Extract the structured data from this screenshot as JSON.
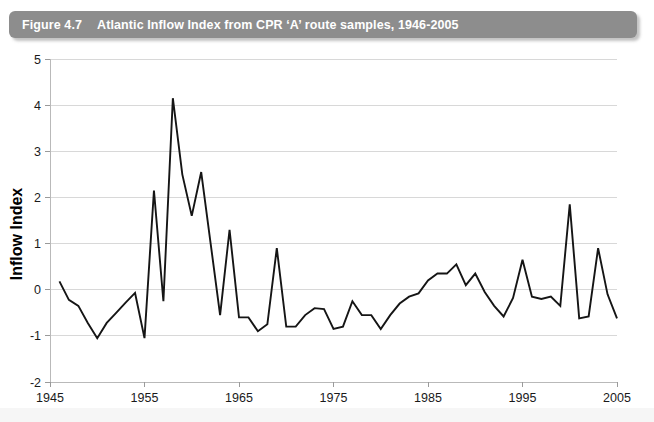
{
  "caption": {
    "number": "Figure 4.7",
    "text": "Atlantic Inflow Index from CPR ‘A’ route samples, 1946-2005"
  },
  "chart_data": {
    "type": "line",
    "title": "Atlantic Inflow Index from CPR ‘A’ route samples, 1946-2005",
    "xlabel": "",
    "ylabel": "Inflow Index",
    "xlim": [
      1945,
      2005
    ],
    "ylim": [
      -2,
      5
    ],
    "xticks": [
      1945,
      1955,
      1965,
      1975,
      1985,
      1995,
      2005
    ],
    "xticklabels": [
      "1945",
      "1955",
      "1965",
      "1975",
      "1985",
      "1995",
      "2005"
    ],
    "yticks": [
      -2,
      -1,
      0,
      1,
      2,
      3,
      4,
      5
    ],
    "yticklabels": [
      "-2",
      "-1",
      "0",
      "1",
      "2",
      "3",
      "4",
      "5"
    ],
    "grid": "horizontal",
    "legend": "none",
    "series": [
      {
        "name": "Inflow Index",
        "color": "#151515",
        "x": [
          1946,
          1947,
          1948,
          1949,
          1950,
          1951,
          1952,
          1953,
          1954,
          1955,
          1956,
          1957,
          1958,
          1959,
          1960,
          1961,
          1962,
          1963,
          1964,
          1965,
          1966,
          1967,
          1968,
          1969,
          1970,
          1971,
          1972,
          1973,
          1974,
          1975,
          1976,
          1977,
          1978,
          1979,
          1980,
          1981,
          1982,
          1983,
          1984,
          1985,
          1986,
          1987,
          1988,
          1989,
          1990,
          1991,
          1992,
          1993,
          1994,
          1995,
          1996,
          1997,
          1998,
          1999,
          2000,
          2001,
          2002,
          2003,
          2004,
          2005
        ],
        "y": [
          0.18,
          -0.22,
          -0.35,
          -0.72,
          -1.05,
          -0.72,
          -0.5,
          -0.28,
          -0.07,
          -1.05,
          2.15,
          -0.25,
          4.15,
          2.5,
          1.6,
          2.55,
          1.0,
          -0.55,
          1.3,
          -0.6,
          -0.6,
          -0.9,
          -0.75,
          0.9,
          -0.8,
          -0.8,
          -0.55,
          -0.4,
          -0.42,
          -0.85,
          -0.8,
          -0.25,
          -0.55,
          -0.55,
          -0.85,
          -0.55,
          -0.3,
          -0.15,
          -0.08,
          0.2,
          0.35,
          0.35,
          0.55,
          0.1,
          0.35,
          -0.05,
          -0.35,
          -0.58,
          -0.18,
          0.65,
          -0.15,
          -0.2,
          -0.15,
          -0.35,
          1.85,
          -0.62,
          -0.58,
          0.9,
          -0.1,
          -0.62
        ]
      }
    ]
  }
}
